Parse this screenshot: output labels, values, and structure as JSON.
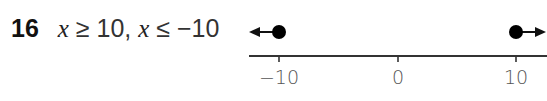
{
  "problem": {
    "number": "16",
    "parts": [
      {
        "var": "x",
        "rest": " ≥ 10, "
      },
      {
        "var": "x",
        "rest": " ≤ −10"
      }
    ]
  },
  "number_line": {
    "tick_labels": [
      "−10",
      "0",
      "10"
    ],
    "tick_values": [
      -10,
      0,
      10
    ],
    "solution": [
      {
        "point": -10,
        "closed": true,
        "direction": "left"
      },
      {
        "point": 10,
        "closed": true,
        "direction": "right"
      }
    ],
    "colors": {
      "line": "#333333",
      "dot": "#000000"
    }
  }
}
